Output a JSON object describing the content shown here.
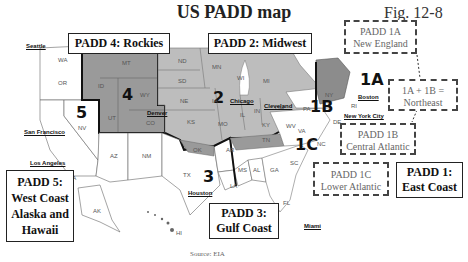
{
  "title": "US PADD map",
  "figure_label": "Fig. 12-8",
  "source": "Source: EIA",
  "padd_boxes": {
    "padd4": "PADD 4: Rockies",
    "padd2": "PADD 2: Midwest",
    "padd3_line1": "PADD 3:",
    "padd3_line2": "Gulf Coast",
    "padd5_line1": "PADD 5:",
    "padd5_line2": "West Coast",
    "padd5_line3": "Alaska and",
    "padd5_line4": "Hawaii",
    "padd1_line1": "PADD 1:",
    "padd1_line2": "East Coast"
  },
  "sub_boxes": {
    "padd1a_line1": "PADD 1A",
    "padd1a_line2": "New England",
    "northeast_line1": "1A + 1B =",
    "northeast_line2": "Northeast",
    "padd1b_line1": "PADD 1B",
    "padd1b_line2": "Central Atlantic",
    "padd1c_line1": "PADD 1C",
    "padd1c_line2": "Lower Atlantic"
  },
  "region_numbers": [
    "1A",
    "1B",
    "1C",
    "2",
    "3",
    "4",
    "5"
  ],
  "cities": {
    "seattle": "Seattle",
    "san_francisco": "San Francisco",
    "los_angeles": "Los Angeles",
    "denver": "Denver",
    "chicago": "Chicago",
    "cleveland": "Cleveland",
    "boston": "Boston",
    "new_york": "New York City",
    "houston": "Houston",
    "miami": "Miami"
  },
  "states": [
    "WA",
    "OR",
    "CA",
    "NV",
    "ID",
    "MT",
    "WY",
    "UT",
    "CO",
    "AZ",
    "NM",
    "ND",
    "SD",
    "NE",
    "KS",
    "MN",
    "IA",
    "MO",
    "WI",
    "IL",
    "MI",
    "IN",
    "OH",
    "KY",
    "TN",
    "OK",
    "TX",
    "AR",
    "LA",
    "MS",
    "AL",
    "GA",
    "SC",
    "NC",
    "VA",
    "WV",
    "PA",
    "NY",
    "FL",
    "AK",
    "HI",
    "RI",
    "DE"
  ],
  "colors": {
    "padd4_fill": "#9a9a9a",
    "padd2_fill": "#bdbdbd",
    "padd1a_fill": "#8c8c8c",
    "default_fill": "#ffffff",
    "border": "#111111"
  }
}
